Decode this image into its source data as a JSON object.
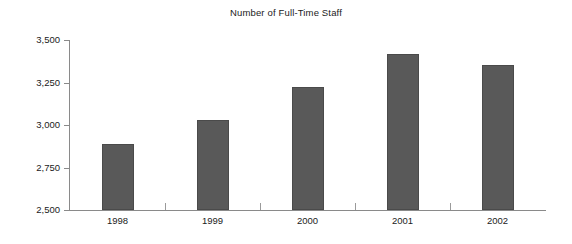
{
  "chart_data": {
    "type": "bar",
    "title": "Number of Full-Time Staff",
    "xlabel": "",
    "ylabel": "",
    "categories": [
      "1998",
      "1999",
      "2000",
      "2001",
      "2002"
    ],
    "values": [
      2890,
      3030,
      3225,
      3420,
      3355
    ],
    "series": [
      {
        "name": "Number of Full-Time Staff",
        "values": [
          2890,
          3030,
          3225,
          3420,
          3355
        ]
      }
    ],
    "ylim": [
      2500,
      3500
    ],
    "y_ticks": [
      2500,
      2750,
      3000,
      3250,
      3500
    ],
    "y_tick_labels": [
      "2,500",
      "2,750",
      "3,000",
      "3,250",
      "3,500"
    ],
    "grid": false,
    "legend": false,
    "legend_position": "none",
    "bar_color": "#595959",
    "bar_border_color": "#4a4a4a",
    "axis_color": "#8a8a8a",
    "background_color": "#ffffff",
    "text_color": "#1b1b1b"
  }
}
